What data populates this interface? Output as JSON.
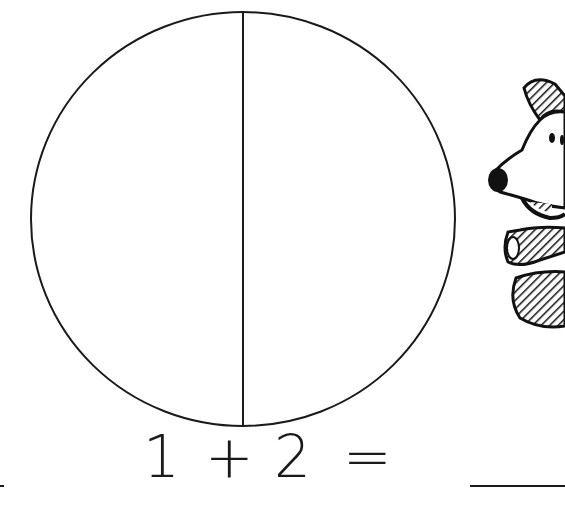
{
  "worksheet": {
    "figure": {
      "shape": "circle",
      "divided_into_parts": 2,
      "stroke_color": "#1a1a1a"
    },
    "equation": {
      "addend1": "1",
      "operator": "+",
      "addend2": "2",
      "equals": "=",
      "answer_blank": ""
    },
    "illustration": "cartoon-dog-icon"
  }
}
